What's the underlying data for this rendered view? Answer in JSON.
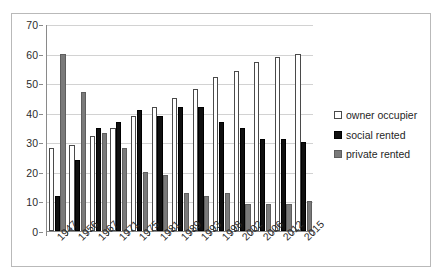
{
  "chart_data": {
    "type": "bar",
    "title": "",
    "xlabel": "",
    "ylabel": "",
    "ylim": [
      0,
      70
    ],
    "ytick_step": 10,
    "yticks": [
      0,
      10,
      20,
      30,
      40,
      50,
      60,
      70
    ],
    "grid": true,
    "legend_position": "right",
    "categories": [
      "1947",
      "1956",
      "1967",
      "1971",
      "1975",
      "1981",
      "1989",
      "1993",
      "1998",
      "2002",
      "2006",
      "2012",
      "2015"
    ],
    "series": [
      {
        "name": "owner occupier",
        "color": "#ffffff",
        "values": [
          28,
          29,
          32,
          35,
          39,
          42,
          45,
          48,
          52,
          54,
          57,
          59,
          60
        ]
      },
      {
        "name": "social rented",
        "color": "#101010",
        "values": [
          12,
          24,
          35,
          37,
          41,
          39,
          42,
          42,
          37,
          35,
          31,
          31,
          30
        ]
      },
      {
        "name": "private rented",
        "color": "#7a7a7a",
        "values": [
          60,
          47,
          33,
          28,
          20,
          19,
          13,
          12,
          13,
          9,
          9,
          9,
          10
        ]
      }
    ]
  },
  "legend": {
    "items": [
      {
        "label": "owner occupier",
        "swatch": "owner"
      },
      {
        "label": "social rented",
        "swatch": "social"
      },
      {
        "label": "private rented",
        "swatch": "private"
      }
    ]
  }
}
